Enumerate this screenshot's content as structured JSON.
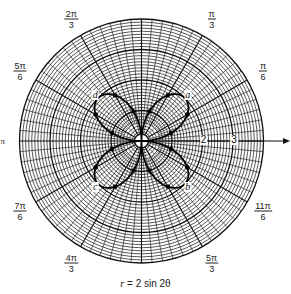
{
  "chart_data": {
    "type": "line",
    "subtype": "polar",
    "title": "",
    "caption": {
      "lhs": "r",
      "rhs": "2 sin 2θ"
    },
    "equation": "r = 2 sin 2θ",
    "grid": {
      "polar": true,
      "rings": 40,
      "max_r": 4,
      "spokes_deg": 5
    },
    "radial_tick_labels": [
      {
        "value": 2,
        "label": "2"
      },
      {
        "value": 3,
        "label": "3"
      }
    ],
    "angle_labels": [
      {
        "deg": 60,
        "num": "π",
        "den": "3"
      },
      {
        "deg": 30,
        "num": "π",
        "den": "6"
      },
      {
        "deg": 120,
        "num": "2π",
        "den": "3"
      },
      {
        "deg": 150,
        "num": "5π",
        "den": "6"
      },
      {
        "deg": 180,
        "single": "π"
      },
      {
        "deg": 210,
        "num": "7π",
        "den": "6"
      },
      {
        "deg": 240,
        "num": "4π",
        "den": "3"
      },
      {
        "deg": 300,
        "num": "5π",
        "den": "3"
      },
      {
        "deg": 330,
        "num": "11π",
        "den": "6"
      }
    ],
    "petal_tips": [
      {
        "label": "a",
        "theta_deg": 45,
        "r": 2
      },
      {
        "label": "d",
        "theta_deg": 135,
        "r": 2
      },
      {
        "label": "c",
        "theta_deg": 225,
        "r": 2
      },
      {
        "label": "b",
        "theta_deg": 315,
        "r": 2
      }
    ],
    "plotted_points_deg": [
      15,
      30,
      60,
      75,
      105,
      120,
      150,
      165,
      195,
      210,
      240,
      255,
      285,
      300,
      330,
      345
    ],
    "series": [
      {
        "name": "r = 2 sin 2θ",
        "theta_range_deg": [
          0,
          360
        ]
      }
    ]
  }
}
